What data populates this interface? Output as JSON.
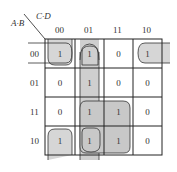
{
  "row_variable_label": "A·B",
  "col_variable_label": "C·D",
  "col_headers": [
    "00",
    "01",
    "11",
    "10"
  ],
  "row_headers": [
    "00",
    "01",
    "11",
    "10"
  ],
  "cells": [
    [
      "1",
      "1",
      "0",
      "1"
    ],
    [
      "0",
      "1",
      "0",
      "0"
    ],
    [
      "0",
      "1",
      "1",
      "0"
    ],
    [
      "1",
      "1",
      "1",
      "0"
    ]
  ],
  "groups": [
    {
      "name": "row00-wrap-group",
      "cells": "row 00, cols 00 and 10 (wrap-around)"
    },
    {
      "name": "col01-group",
      "cells": "col 01, all rows"
    },
    {
      "name": "quad-group",
      "cells": "rows 11-10, cols 01-11"
    },
    {
      "name": "col00-wrap-group",
      "cells": "col 00, rows 00 and 10 (wrap-around)"
    }
  ],
  "colors": {
    "group_fill": "#d4d4d4",
    "line": "#222222"
  }
}
